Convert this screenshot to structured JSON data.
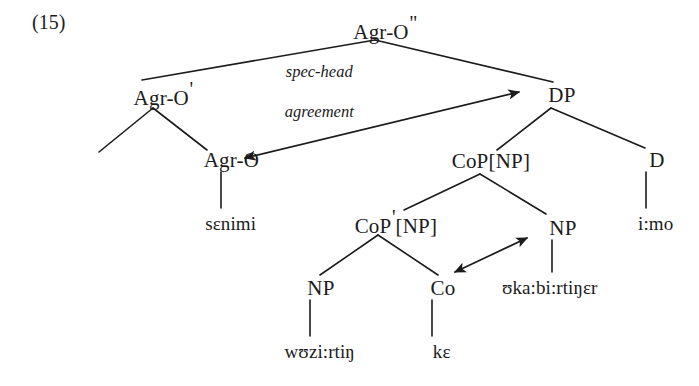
{
  "figure": {
    "example_number": "(15)",
    "annotation": {
      "line1": "spec-head",
      "line2": "agreement"
    },
    "ink_color": "#1b1b1b",
    "background_color": "#ffffff"
  },
  "nodes": {
    "root": {
      "label": "Agr-O",
      "prime": "\"",
      "x": 375,
      "y": 28
    },
    "agro_bar": {
      "label": "Agr-O",
      "prime": "'",
      "x": 153,
      "y": 94
    },
    "agro_head": {
      "label": "Agr-O",
      "prime": "",
      "x": 221,
      "y": 160
    },
    "dp": {
      "label": "DP",
      "prime": "",
      "x": 551,
      "y": 95
    },
    "cop_np": {
      "label": "CoP[NP]",
      "prime": "",
      "x": 480,
      "y": 161
    },
    "d": {
      "label": "D",
      "prime": "",
      "x": 646,
      "y": 160
    },
    "cop_bar_np": {
      "label": "CoP",
      "prime": "'",
      "bracket": "[NP]",
      "x": 385,
      "y": 222
    },
    "np_left": {
      "label": "NP",
      "prime": "",
      "x": 310,
      "y": 288
    },
    "co": {
      "label": "Co",
      "prime": "",
      "x": 432,
      "y": 288
    },
    "np_right": {
      "label": "NP",
      "prime": "",
      "x": 552,
      "y": 228
    }
  },
  "terminals": {
    "senimi": {
      "text": "sɛnimi",
      "x": 221,
      "y": 224
    },
    "wazirtin": {
      "text": "wʊzi:rtiŋ",
      "x": 310,
      "y": 352
    },
    "ke": {
      "text": "kɛ",
      "x": 432,
      "y": 352
    },
    "akabirtiner": {
      "text": "ʊka:bi:rtiŋɛr",
      "x": 540,
      "y": 288
    },
    "imo": {
      "text": "i:mo",
      "x": 646,
      "y": 224
    }
  },
  "edges": [
    {
      "name": "root-to-agro-bar",
      "x1": 375,
      "y1": 40,
      "x2": 142,
      "y2": 80
    },
    {
      "name": "root-to-dp",
      "x1": 375,
      "y1": 40,
      "x2": 553,
      "y2": 82
    },
    {
      "name": "agro-bar-to-spec",
      "x1": 153,
      "y1": 108,
      "x2": 99,
      "y2": 152
    },
    {
      "name": "agro-bar-to-agro-head",
      "x1": 153,
      "y1": 108,
      "x2": 207,
      "y2": 150
    },
    {
      "name": "agro-head-to-senimi",
      "x1": 221,
      "y1": 172,
      "x2": 221,
      "y2": 208
    },
    {
      "name": "dp-to-cop-np",
      "x1": 551,
      "y1": 108,
      "x2": 497,
      "y2": 150
    },
    {
      "name": "dp-to-d",
      "x1": 551,
      "y1": 108,
      "x2": 645,
      "y2": 148
    },
    {
      "name": "d-to-imo",
      "x1": 646,
      "y1": 172,
      "x2": 646,
      "y2": 208
    },
    {
      "name": "cop-np-to-cop-bar-np",
      "x1": 480,
      "y1": 174,
      "x2": 404,
      "y2": 210
    },
    {
      "name": "cop-np-to-np-right",
      "x1": 480,
      "y1": 174,
      "x2": 546,
      "y2": 214
    },
    {
      "name": "cop-bar-np-to-np-left",
      "x1": 378,
      "y1": 235,
      "x2": 320,
      "y2": 275
    },
    {
      "name": "cop-bar-np-to-co",
      "x1": 378,
      "y1": 235,
      "x2": 438,
      "y2": 275
    },
    {
      "name": "np-left-to-wazirtin",
      "x1": 310,
      "y1": 300,
      "x2": 310,
      "y2": 336
    },
    {
      "name": "co-to-ke",
      "x1": 432,
      "y1": 300,
      "x2": 432,
      "y2": 336
    },
    {
      "name": "np-right-to-akabirtiner",
      "x1": 552,
      "y1": 240,
      "x2": 552,
      "y2": 272
    }
  ],
  "arrows": [
    {
      "name": "spec-head-agreement-arrow",
      "x1": 519,
      "y1": 92,
      "x2": 245,
      "y2": 158,
      "heads": "both"
    },
    {
      "name": "coordination-arrow",
      "x1": 455,
      "y1": 272,
      "x2": 527,
      "y2": 238,
      "heads": "both"
    }
  ]
}
